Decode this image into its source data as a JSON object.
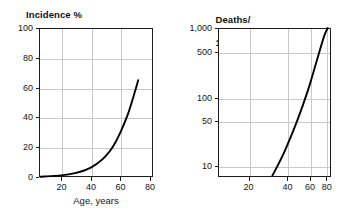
{
  "figure": {
    "background": "#ffffff",
    "curve_color": "#000000",
    "grid_color": "#c9c9c9",
    "axis_color": "#1c1c1c"
  },
  "panels": [
    {
      "id": "left",
      "title": "Incidence %",
      "xlabel": "Age, years"
    },
    {
      "id": "right",
      "title_line1": "Deaths/",
      "title_line2": "100,000 (ASR)",
      "xlabel": "Age, years"
    }
  ],
  "chart_data": [
    {
      "type": "line",
      "title": "Incidence %",
      "xlabel": "Age, years",
      "ylabel": "Incidence %",
      "xscale": "linear",
      "yscale": "linear",
      "xlim": [
        5,
        82
      ],
      "ylim": [
        0,
        100
      ],
      "xticks": [
        20,
        40,
        60,
        80
      ],
      "xticklabels": [
        "20",
        "40",
        "60",
        "80"
      ],
      "yticks": [
        0,
        20,
        40,
        60,
        80,
        100
      ],
      "yticklabels": [
        "0",
        "20",
        "40",
        "60",
        "80",
        "100"
      ],
      "grid": true,
      "legend": null,
      "series": [
        {
          "name": "Incidence",
          "x": [
            6,
            10,
            15,
            20,
            25,
            30,
            35,
            40,
            45,
            50,
            55,
            60,
            65,
            70,
            72
          ],
          "y": [
            0.2,
            0.4,
            0.7,
            1.1,
            1.8,
            2.8,
            4.2,
            6.3,
            9.5,
            14.0,
            20.5,
            30.0,
            42.0,
            58.0,
            65.0
          ]
        }
      ]
    },
    {
      "type": "line",
      "title": "Deaths/100,000 (ASR)",
      "xlabel": "Age, years",
      "ylabel": "Deaths/100,000 (ASR)",
      "xscale": "log",
      "yscale": "log",
      "xlim": [
        10,
        85
      ],
      "ylim": [
        4,
        1000
      ],
      "xticks": [
        20,
        40,
        60,
        80
      ],
      "xticklabels": [
        "20",
        "40",
        "60",
        "80"
      ],
      "yticks": [
        10,
        50,
        100,
        500,
        1000
      ],
      "yticklabels": [
        "10",
        "50",
        "100",
        "500",
        "1,000"
      ],
      "grid": true,
      "legend": null,
      "series": [
        {
          "name": "Mortality",
          "x": [
            28,
            35,
            45,
            55,
            65,
            75,
            80
          ],
          "y": [
            4.2,
            10.0,
            33.0,
            100.0,
            300.0,
            760.0,
            1000.0
          ]
        }
      ]
    }
  ],
  "left_axis": {
    "yticklabels": [
      "100",
      "80",
      "60",
      "40",
      "20",
      "0"
    ],
    "xticklabels": [
      "20",
      "40",
      "60",
      "80"
    ],
    "caption": "Age, years"
  },
  "right_axis": {
    "yticklabels": [
      "1,000",
      "500",
      "100",
      "50",
      "10"
    ],
    "xticklabels": [
      "20",
      "40",
      "60",
      "80"
    ],
    "caption": "Age, years"
  }
}
